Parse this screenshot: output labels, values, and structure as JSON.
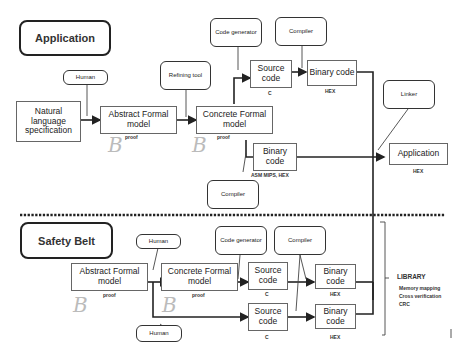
{
  "sections": {
    "application": {
      "title": "Application"
    },
    "safety_belt": {
      "title": "Safety Belt"
    }
  },
  "top": {
    "human": "Human",
    "refining_tool": "Refining tool",
    "code_generator": "Code generator",
    "compiler_top": "Compiler",
    "linker": "Linker",
    "compiler_bottom": "Compiler",
    "natural_spec": "Natural language specification",
    "abstract_model": "Abstract Formal model",
    "abstract_model_label": "proof",
    "concrete_model": "Concrete Formal model",
    "concrete_model_label": "proof",
    "source_code": "Source code",
    "source_code_label": "C",
    "binary_code_1": "Binary code",
    "binary_code_1_label": "HEX",
    "binary_code_2": "Binary code",
    "binary_code_2_label": "ASM MIPS, HEX",
    "application_out": "Application",
    "application_out_label": "HEX",
    "b_marks": [
      "B",
      "B"
    ]
  },
  "bottom": {
    "human_top": "Human",
    "human_bottom": "Human",
    "code_generator": "Code generator",
    "compiler": "Compiler",
    "abstract_model": "Abstract Formal model",
    "abstract_model_label": "proof",
    "concrete_model": "Concrete Formal model",
    "concrete_model_label": "proof",
    "source_code_1": "Source code",
    "source_code_1_label": "C",
    "source_code_2": "Source code",
    "source_code_2_label": "C",
    "binary_code_1": "Binary code",
    "binary_code_1_label": "HEX",
    "binary_code_2": "Binary code",
    "binary_code_2_label": "HEX",
    "b_marks": [
      "B",
      "B"
    ]
  },
  "library": {
    "title": "LIBRARY",
    "items": [
      "Memory mapping",
      "Cross verification",
      "CRC"
    ]
  }
}
